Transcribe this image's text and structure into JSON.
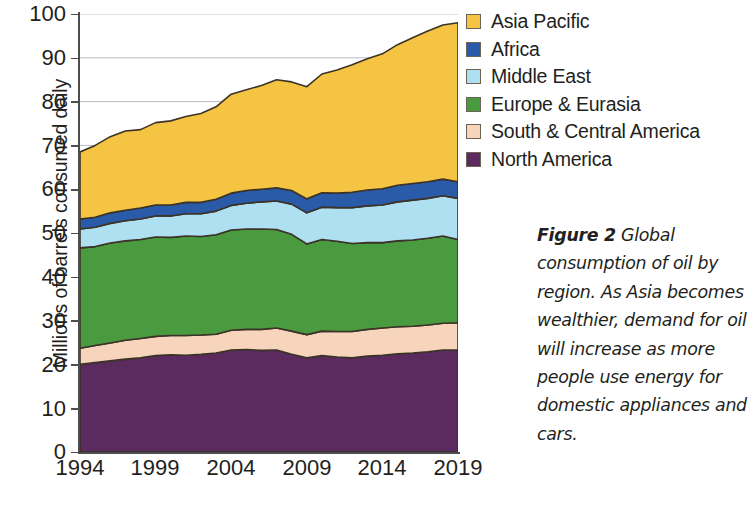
{
  "figure": {
    "caption_label": "Figure 2",
    "caption_text": " Global consumption of oil by region. As Asia becomes wealthier, demand for oil will increase as more people use energy for domestic appliances and cars."
  },
  "axes": {
    "ylabel": "Millions of barrels consumed daily",
    "yticks": [
      "100",
      "90",
      "80",
      "70",
      "60",
      "50",
      "40",
      "30",
      "20",
      "10",
      "0"
    ],
    "xticks": [
      "1994",
      "1999",
      "2004",
      "2009",
      "2014",
      "2019"
    ]
  },
  "legend": {
    "items": [
      {
        "label": "Asia Pacific",
        "color": "#F5C443"
      },
      {
        "label": "Africa",
        "color": "#2A5BA8"
      },
      {
        "label": "Middle East",
        "color": "#AEE0F2"
      },
      {
        "label": "Europe & Eurasia",
        "color": "#4A9B3F"
      },
      {
        "label": "South & Central America",
        "color": "#F7D5BC"
      },
      {
        "label": "North America",
        "color": "#5B2A5E"
      }
    ]
  },
  "chart_data": {
    "type": "area",
    "title": "",
    "xlabel": "",
    "ylabel": "Millions of barrels consumed daily",
    "xlim": [
      1994,
      2019
    ],
    "ylim": [
      0,
      100
    ],
    "grid": true,
    "gridlines": [
      70,
      80,
      90,
      100
    ],
    "legend_position": "right",
    "stacked": true,
    "stack_order_bottom_to_top": [
      "North America",
      "South & Central America",
      "Europe & Eurasia",
      "Middle East",
      "Africa",
      "Asia Pacific"
    ],
    "x": [
      1994,
      1995,
      1996,
      1997,
      1998,
      1999,
      2000,
      2001,
      2002,
      2003,
      2004,
      2005,
      2006,
      2007,
      2008,
      2009,
      2010,
      2011,
      2012,
      2013,
      2014,
      2015,
      2016,
      2017,
      2018,
      2019
    ],
    "series": [
      {
        "name": "North America",
        "color": "#5B2A5E",
        "values": [
          20.0,
          20.4,
          20.8,
          21.2,
          21.5,
          22.0,
          22.2,
          22.1,
          22.3,
          22.6,
          23.3,
          23.4,
          23.2,
          23.3,
          22.3,
          21.5,
          22.0,
          21.7,
          21.5,
          21.9,
          22.1,
          22.4,
          22.6,
          22.9,
          23.3,
          23.3
        ],
        "unit": "million barrels per day"
      },
      {
        "name": "South & Central America",
        "color": "#F7D5BC",
        "values": [
          3.7,
          3.9,
          4.1,
          4.3,
          4.4,
          4.4,
          4.4,
          4.5,
          4.4,
          4.3,
          4.5,
          4.6,
          4.8,
          5.0,
          5.3,
          5.3,
          5.6,
          5.8,
          6.0,
          6.1,
          6.2,
          6.2,
          6.1,
          6.1,
          6.1,
          6.2
        ],
        "unit": "million barrels per day"
      },
      {
        "name": "Europe & Eurasia",
        "color": "#4A9B3F",
        "values": [
          22.9,
          22.6,
          22.8,
          22.7,
          22.6,
          22.7,
          22.4,
          22.7,
          22.5,
          22.7,
          22.9,
          22.9,
          22.9,
          22.5,
          22.1,
          20.7,
          20.9,
          20.6,
          20.1,
          19.8,
          19.5,
          19.6,
          19.7,
          19.8,
          19.9,
          19.0
        ],
        "unit": "million barrels per day"
      },
      {
        "name": "Middle East",
        "color": "#AEE0F2",
        "values": [
          4.3,
          4.4,
          4.5,
          4.6,
          4.7,
          4.8,
          4.9,
          5.1,
          5.2,
          5.4,
          5.6,
          5.9,
          6.2,
          6.5,
          6.9,
          7.1,
          7.4,
          7.7,
          8.2,
          8.4,
          8.6,
          8.9,
          9.1,
          9.1,
          9.2,
          9.4
        ],
        "unit": "million barrels per day"
      },
      {
        "name": "Africa",
        "color": "#2A5BA8",
        "values": [
          2.3,
          2.3,
          2.4,
          2.4,
          2.5,
          2.5,
          2.5,
          2.6,
          2.6,
          2.7,
          2.8,
          2.9,
          2.9,
          3.0,
          3.1,
          3.2,
          3.3,
          3.3,
          3.5,
          3.6,
          3.7,
          3.8,
          3.8,
          3.8,
          3.8,
          3.8
        ],
        "unit": "million barrels per day"
      },
      {
        "name": "Asia Pacific",
        "color": "#F5C443",
        "values": [
          15.3,
          16.4,
          17.4,
          18.1,
          17.9,
          18.8,
          19.2,
          19.6,
          20.3,
          21.1,
          22.6,
          23.0,
          23.7,
          24.7,
          24.8,
          25.6,
          27.1,
          28.1,
          29.1,
          30.0,
          30.8,
          32.1,
          33.3,
          34.4,
          35.2,
          36.3
        ],
        "unit": "million barrels per day"
      }
    ],
    "totals": [
      68.5,
      70.0,
      72.0,
      73.3,
      73.6,
      75.2,
      75.6,
      76.6,
      77.3,
      78.8,
      81.7,
      82.7,
      83.7,
      85.0,
      84.5,
      83.4,
      86.3,
      87.2,
      88.4,
      89.8,
      90.9,
      93.0,
      94.6,
      96.1,
      97.5,
      98.0
    ],
    "annotations": []
  }
}
